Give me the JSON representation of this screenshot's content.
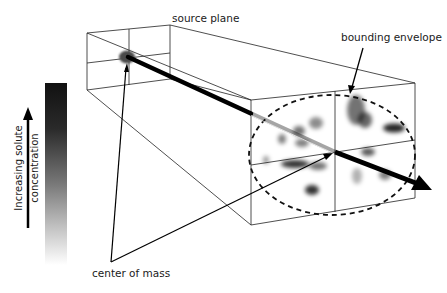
{
  "figure": {
    "labels": {
      "source_plane": "source plane",
      "bounding_envelope": "bounding envelope",
      "center_of_mass": "center of mass",
      "concentration_line1": "Increasing solute",
      "concentration_line2": "concentration"
    },
    "colors": {
      "line": "#1a1a1a",
      "beam": "#000000",
      "source_blob": "#4a4a4a",
      "gradient_top": "#111111",
      "gradient_bottom": "#ffffff",
      "background": "#ffffff"
    },
    "source_plane": {
      "corners": {
        "tl": [
          87,
          33
        ],
        "tr": [
          170,
          25
        ],
        "br": [
          170,
          79
        ],
        "bl": [
          87,
          90
        ]
      },
      "mid_vertical_x": 129,
      "mid_horizontal": [
        [
          87,
          63
        ],
        [
          170,
          53
        ]
      ],
      "source_point": [
        128,
        57
      ]
    },
    "target_plane": {
      "corners": {
        "tl": [
          251,
          100
        ],
        "tr": [
          415,
          83
        ],
        "br": [
          415,
          198
        ],
        "bl": [
          251,
          225
        ]
      },
      "mid_vertical_x": 335,
      "mid_horizontal": [
        [
          251,
          165
        ],
        [
          415,
          140
        ]
      ],
      "center_of_mass": [
        335,
        152
      ],
      "envelope": {
        "cx": 332,
        "cy": 155,
        "rx": 83,
        "ry": 60
      }
    },
    "beam": {
      "from": [
        128,
        57
      ],
      "through": [
        335,
        152
      ],
      "tip": [
        432,
        190
      ]
    },
    "blobs": [
      {
        "cx": 356,
        "cy": 110,
        "rx": 9,
        "ry": 15,
        "opacity": 0.55
      },
      {
        "cx": 365,
        "cy": 120,
        "rx": 7,
        "ry": 8,
        "opacity": 0.6
      },
      {
        "cx": 394,
        "cy": 128,
        "rx": 11,
        "ry": 4.5,
        "opacity": 0.85
      },
      {
        "cx": 316,
        "cy": 123,
        "rx": 7,
        "ry": 6,
        "opacity": 0.45
      },
      {
        "cx": 299,
        "cy": 131,
        "rx": 6,
        "ry": 5,
        "opacity": 0.55
      },
      {
        "cx": 282,
        "cy": 139,
        "rx": 4,
        "ry": 5,
        "opacity": 0.5
      },
      {
        "cx": 302,
        "cy": 143,
        "rx": 7,
        "ry": 4,
        "opacity": 0.5
      },
      {
        "cx": 266,
        "cy": 160,
        "rx": 3,
        "ry": 4,
        "opacity": 0.4
      },
      {
        "cx": 295,
        "cy": 164,
        "rx": 14,
        "ry": 4,
        "opacity": 0.8
      },
      {
        "cx": 318,
        "cy": 166,
        "rx": 9,
        "ry": 4,
        "opacity": 0.55
      },
      {
        "cx": 312,
        "cy": 190,
        "rx": 7,
        "ry": 5,
        "opacity": 0.8
      },
      {
        "cx": 368,
        "cy": 152,
        "rx": 7,
        "ry": 4,
        "opacity": 0.65
      },
      {
        "cx": 357,
        "cy": 176,
        "rx": 5,
        "ry": 8,
        "opacity": 0.3
      },
      {
        "cx": 385,
        "cy": 175,
        "rx": 6,
        "ry": 5,
        "opacity": 0.5
      }
    ],
    "legend": {
      "gradient_bar": {
        "x": 45,
        "y": 83,
        "w": 22,
        "h": 182
      },
      "arrow": {
        "x": 28,
        "y1": 228,
        "y2": 107
      }
    }
  }
}
